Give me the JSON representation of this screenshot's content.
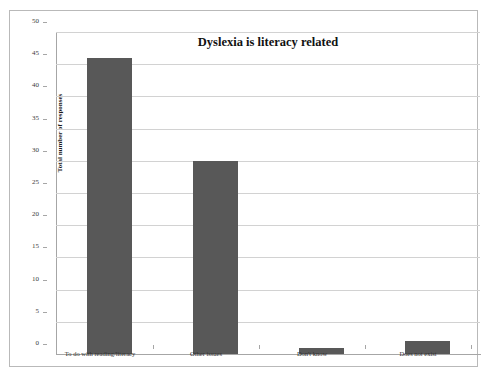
{
  "chart_data": {
    "type": "bar",
    "title": "Dyslexia is literacy related",
    "xlabel": "",
    "ylabel": "Total number of responses",
    "categories": [
      "To do with reading/literacy",
      "Other issues",
      "Don't know",
      "Does not exist"
    ],
    "values": [
      46,
      30,
      1,
      2
    ],
    "ylim": [
      0,
      50
    ],
    "yticks": [
      0,
      5,
      10,
      15,
      20,
      25,
      30,
      35,
      40,
      45,
      50
    ],
    "ytick_labels": [
      "0",
      "5",
      "10",
      "15",
      "20",
      "25",
      "30",
      "35",
      "40",
      "45",
      "50"
    ],
    "grid": true,
    "legend": false,
    "bar_color": "#585858",
    "gridline_color": "#d2d2d2",
    "axis_color": "#a6a6a6",
    "frame_color": "#b9b9b9",
    "background": "#ffffff"
  }
}
